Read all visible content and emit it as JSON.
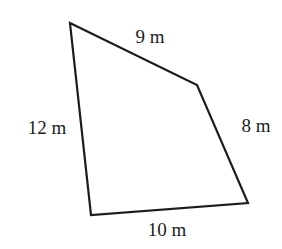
{
  "figure": {
    "kind": "quadrilateral",
    "background": "#ffffff",
    "line_color": "#1c1c1c",
    "line_width": 2.2,
    "vertices": [
      {
        "name": "top-left",
        "x": 70,
        "y": 23
      },
      {
        "name": "right",
        "x": 197,
        "y": 85
      },
      {
        "name": "bottom-right",
        "x": 248,
        "y": 203
      },
      {
        "name": "bottom-left",
        "x": 91,
        "y": 215
      }
    ],
    "side_labels": [
      {
        "id": "top",
        "text": "9 m",
        "x": 150,
        "y": 36
      },
      {
        "id": "right",
        "text": "8 m",
        "x": 256,
        "y": 125
      },
      {
        "id": "bottom",
        "text": "10 m",
        "x": 167,
        "y": 229
      },
      {
        "id": "left",
        "text": "12 m",
        "x": 47,
        "y": 127
      }
    ]
  }
}
